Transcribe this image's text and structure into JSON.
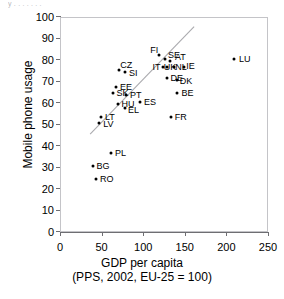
{
  "top_remnant_text": "y  .       .                  .   .        .           . .",
  "chart_data": {
    "type": "scatter",
    "title": "",
    "xlabel": "GDP per capita",
    "xlabel_line2": "(PPS, 2002, EU-25 = 100)",
    "ylabel": "Mobile phone usage",
    "xlim": [
      0,
      250
    ],
    "ylim": [
      0,
      100
    ],
    "xticks": [
      0,
      50,
      100,
      150,
      200,
      250
    ],
    "yticks": [
      0,
      10,
      20,
      30,
      40,
      50,
      60,
      70,
      80,
      90,
      100
    ],
    "grid": false,
    "legend": "none",
    "marker_color": "#000000",
    "trendline_color": "#aaaaae",
    "frame_color": "#c4c4c8",
    "trendline": {
      "x": [
        35,
        160
      ],
      "y": [
        46,
        96
      ]
    },
    "points": [
      {
        "label": "LU",
        "x": 208,
        "y": 81,
        "label_dx": 5,
        "label_dy": 0
      },
      {
        "label": "FI",
        "x": 118,
        "y": 83,
        "label_dx": -9,
        "label_dy": -5
      },
      {
        "label": "SE",
        "x": 125,
        "y": 81,
        "label_dx": 3,
        "label_dy": -4
      },
      {
        "label": "AT",
        "x": 131,
        "y": 80,
        "label_dx": 5,
        "label_dy": -4
      },
      {
        "label": "CZ",
        "x": 70,
        "y": 76,
        "label_dx": 1,
        "label_dy": -5
      },
      {
        "label": "SI",
        "x": 77,
        "y": 75,
        "label_dx": 4,
        "label_dy": 1
      },
      {
        "label": "IT",
        "x": 122,
        "y": 77,
        "label_dx": -10,
        "label_dy": 0
      },
      {
        "label": "UK",
        "x": 127,
        "y": 77,
        "label_dx": -3,
        "label_dy": 0
      },
      {
        "label": "NL",
        "x": 136,
        "y": 77,
        "label_dx": 1,
        "label_dy": 0
      },
      {
        "label": "IE",
        "x": 148,
        "y": 77,
        "label_dx": 2,
        "label_dy": -1
      },
      {
        "label": "DE",
        "x": 128,
        "y": 72,
        "label_dx": 3,
        "label_dy": 0
      },
      {
        "label": "DK",
        "x": 139,
        "y": 71,
        "label_dx": 3,
        "label_dy": 1
      },
      {
        "label": "EE",
        "x": 66,
        "y": 68,
        "label_dx": 4,
        "label_dy": 0
      },
      {
        "label": "SK",
        "x": 62,
        "y": 65,
        "label_dx": 4,
        "label_dy": 0
      },
      {
        "label": "PT",
        "x": 78,
        "y": 64,
        "label_dx": 4,
        "label_dy": 0
      },
      {
        "label": "BE",
        "x": 140,
        "y": 65,
        "label_dx": 4,
        "label_dy": 0
      },
      {
        "label": "HU",
        "x": 68,
        "y": 60,
        "label_dx": 4,
        "label_dy": 0
      },
      {
        "label": "EL",
        "x": 77,
        "y": 58,
        "label_dx": 3,
        "label_dy": 2
      },
      {
        "label": "ES",
        "x": 95,
        "y": 61,
        "label_dx": 4,
        "label_dy": 0
      },
      {
        "label": "FR",
        "x": 132,
        "y": 54,
        "label_dx": 4,
        "label_dy": 0
      },
      {
        "label": "LT",
        "x": 48,
        "y": 54,
        "label_dx": 4,
        "label_dy": 0
      },
      {
        "label": "LV",
        "x": 46,
        "y": 51,
        "label_dx": 4,
        "label_dy": 1
      },
      {
        "label": "PL",
        "x": 60,
        "y": 37,
        "label_dx": 4,
        "label_dy": 0
      },
      {
        "label": "BG",
        "x": 38,
        "y": 31,
        "label_dx": 4,
        "label_dy": 0
      },
      {
        "label": "RO",
        "x": 42,
        "y": 25,
        "label_dx": 4,
        "label_dy": 0
      }
    ]
  }
}
